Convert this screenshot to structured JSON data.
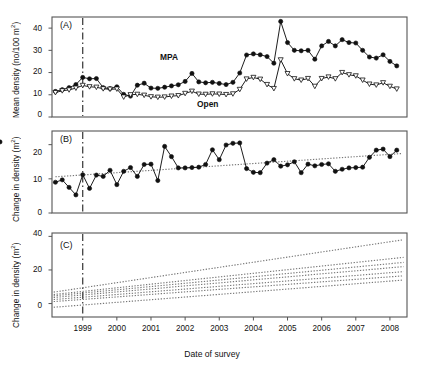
{
  "figure": {
    "title": "",
    "xlabel": "Date of survey",
    "panels": [
      "(A)",
      "(B)",
      "(C)"
    ]
  },
  "panelA": {
    "tag": "(A)",
    "ylabel_text": "Mean density (no/100 m",
    "ylabel_sup": "2",
    "ylabel_tail": ")",
    "yticks": [
      "0",
      "10",
      "20",
      "30",
      "40"
    ],
    "series_labels": {
      "mpa": "MPA",
      "open": "Open"
    }
  },
  "panelB": {
    "tag": "(B)",
    "ylabel_text": "Change in density (m",
    "ylabel_sup": "2",
    "ylabel_tail": ")",
    "yticks": [
      "0",
      "10",
      "20"
    ]
  },
  "panelC": {
    "tag": "(C)",
    "ylabel_text": "Change in density (m",
    "ylabel_sup": "2",
    "ylabel_tail": ")",
    "yticks": [
      "0",
      "20",
      "40"
    ]
  },
  "xticks": [
    "1999",
    "2000",
    "2001",
    "2002",
    "2003",
    "2004",
    "2005",
    "2006",
    "2007",
    "2008"
  ],
  "colors": {
    "line": "#111111",
    "frame": "#555555",
    "dotted": "#777777",
    "marker_fill": "#111111",
    "marker_open": "#ffffff"
  },
  "chart_data": [
    {
      "type": "line",
      "panel": "A",
      "title": "Mean density of fish inside MPA vs open areas",
      "xlabel": "Date of survey",
      "ylabel": "Mean density (no/100 m2)",
      "ylim": [
        0,
        45
      ],
      "xlim": [
        1998.55,
        2008.95
      ],
      "yticks": [
        0,
        10,
        20,
        30,
        40
      ],
      "grid": false,
      "legend": [
        "MPA",
        "Open"
      ],
      "legend_position": "inline-annotation",
      "reference_line_x": 1999.45,
      "x": [
        1998.65,
        1998.85,
        1999.05,
        1999.25,
        1999.45,
        1999.65,
        1999.85,
        2000.05,
        2000.25,
        2000.45,
        2000.65,
        2000.85,
        2001.05,
        2001.25,
        2001.45,
        2001.65,
        2001.85,
        2002.05,
        2002.25,
        2002.45,
        2002.65,
        2002.85,
        2003.05,
        2003.25,
        2003.45,
        2003.65,
        2003.85,
        2004.05,
        2004.25,
        2004.45,
        2004.65,
        2004.85,
        2005.05,
        2005.25,
        2005.45,
        2005.65,
        2005.85,
        2006.05,
        2006.25,
        2006.45,
        2006.65,
        2006.85,
        2007.05,
        2007.25,
        2007.45,
        2007.65,
        2007.85,
        2008.05,
        2008.25,
        2008.45,
        2008.65
      ],
      "series": [
        {
          "name": "MPA",
          "marker": "filled-circle",
          "values": [
            11.5,
            12.3,
            13.2,
            14.6,
            17.8,
            17.2,
            17.3,
            13.2,
            12.8,
            13.6,
            10.2,
            9.4,
            14.3,
            15.2,
            13.0,
            12.9,
            13.4,
            14.0,
            14.5,
            16.0,
            19.6,
            15.8,
            15.4,
            15.6,
            15.1,
            14.6,
            15.6,
            19.8,
            27.9,
            28.4,
            28.0,
            27.2,
            24.2,
            43.0,
            33.5,
            30.0,
            29.8,
            30.0,
            26.0,
            32.0,
            34.0,
            32.0,
            34.8,
            33.5,
            33.3,
            30.0,
            27.0,
            26.5,
            28.0,
            25.0,
            23.0
          ]
        },
        {
          "name": "Open",
          "marker": "open-triangle-down",
          "values": [
            11.0,
            11.8,
            12.2,
            13.0,
            14.2,
            13.6,
            13.4,
            12.7,
            12.5,
            12.6,
            9.0,
            10.0,
            10.2,
            9.8,
            9.1,
            8.9,
            9.0,
            9.4,
            9.6,
            10.6,
            11.6,
            10.3,
            10.2,
            10.4,
            10.3,
            10.1,
            10.4,
            12.4,
            17.1,
            17.8,
            17.0,
            14.6,
            12.8,
            25.7,
            19.5,
            17.2,
            16.6,
            17.3,
            13.8,
            17.3,
            18.0,
            17.2,
            20.0,
            19.0,
            18.5,
            16.6,
            14.8,
            14.4,
            15.4,
            13.8,
            12.6
          ]
        }
      ]
    },
    {
      "type": "line",
      "panel": "B",
      "title": "Change in density over time",
      "xlabel": "Date of survey",
      "ylabel": "Change in density (m2)",
      "ylim": [
        0,
        24
      ],
      "xlim": [
        1998.55,
        2008.95
      ],
      "yticks": [
        0,
        10,
        20
      ],
      "grid": false,
      "reference_line_x": 1999.45,
      "x": [
        1998.65,
        1998.85,
        1999.05,
        1999.25,
        1999.45,
        1999.65,
        1999.85,
        2000.05,
        2000.25,
        2000.45,
        2000.65,
        2000.85,
        2001.05,
        2001.25,
        2001.45,
        2001.65,
        2001.85,
        2002.05,
        2002.25,
        2002.45,
        2002.65,
        2002.85,
        2003.05,
        2003.25,
        2003.45,
        2003.65,
        2003.85,
        2004.05,
        2004.25,
        2004.45,
        2004.65,
        2004.85,
        2005.05,
        2005.25,
        2005.45,
        2005.65,
        2005.85,
        2006.05,
        2006.25,
        2006.45,
        2006.65,
        2006.85,
        2007.05,
        2007.25,
        2007.45,
        2007.65,
        2007.85,
        2008.05,
        2008.25,
        2008.45,
        2008.65
      ],
      "series": [
        {
          "name": "Change in density",
          "marker": "filled-circle",
          "values": [
            9.0,
            9.7,
            7.5,
            5.3,
            11.2,
            7.2,
            11.1,
            10.7,
            12.5,
            8.3,
            12.2,
            13.3,
            10.7,
            14.2,
            14.3,
            9.5,
            19.5,
            16.5,
            13.2,
            13.2,
            13.3,
            13.4,
            14.2,
            18.5,
            15.6,
            19.9,
            20.4,
            20.5,
            13.0,
            11.9,
            11.8,
            14.6,
            15.6,
            13.7,
            14.1,
            15.0,
            11.8,
            14.3,
            13.8,
            14.2,
            14.4,
            12.2,
            12.8,
            13.2,
            13.3,
            13.4,
            16.3,
            18.4,
            18.7,
            16.5,
            18.4,
            20.8
          ]
        }
      ],
      "trend_lines": [
        {
          "name": "fitted-trend",
          "style": "dotted",
          "x0": 1998.65,
          "y0": 10.6,
          "x1": 2008.8,
          "y1": 17.4
        }
      ]
    },
    {
      "type": "line",
      "panel": "C",
      "title": "Modelled change in density trajectories",
      "xlabel": "Date of survey",
      "ylabel": "Change in density (m2)",
      "ylim": [
        -8,
        42
      ],
      "xlim": [
        1998.55,
        2008.95
      ],
      "yticks": [
        0,
        20,
        40
      ],
      "grid": false,
      "reference_line_x": 1999.45,
      "style": "dotted",
      "trend_lines": [
        {
          "name": "line-1",
          "style": "dotted",
          "x0": 1998.6,
          "y0": 6.8,
          "x1": 2008.85,
          "y1": 38.0
        },
        {
          "name": "line-2",
          "style": "dotted",
          "x0": 1998.6,
          "y0": 5.4,
          "x1": 2008.85,
          "y1": 27.5
        },
        {
          "name": "line-3",
          "style": "dotted",
          "x0": 1998.6,
          "y0": 4.6,
          "x1": 2008.85,
          "y1": 24.5
        },
        {
          "name": "line-4",
          "style": "dotted",
          "x0": 1998.6,
          "y0": 3.6,
          "x1": 2008.85,
          "y1": 22.0
        },
        {
          "name": "line-5",
          "style": "dotted",
          "x0": 1998.6,
          "y0": 2.4,
          "x1": 2008.85,
          "y1": 19.0
        },
        {
          "name": "line-6",
          "style": "dotted",
          "x0": 1998.6,
          "y0": 1.2,
          "x1": 2008.85,
          "y1": 16.5
        },
        {
          "name": "line-7",
          "style": "dotted",
          "x0": 1998.6,
          "y0": -2.2,
          "x1": 2008.85,
          "y1": 14.0
        }
      ]
    }
  ]
}
